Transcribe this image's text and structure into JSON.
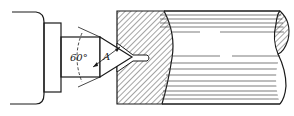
{
  "diagram": {
    "labels": {
      "angle": "60°",
      "dimension": "A"
    },
    "parts": [
      {
        "id": "headstock",
        "name": "Headstock / spindle nose"
      },
      {
        "id": "lathe-center",
        "name": "Lathe center with 60° conical point"
      },
      {
        "id": "workpiece",
        "name": "Cylindrical workpiece (sectioned end)"
      },
      {
        "id": "center-hole",
        "name": "Drilled center hole"
      }
    ],
    "colors": {
      "ink": "#1a1a1a",
      "paper": "#ffffff"
    }
  }
}
